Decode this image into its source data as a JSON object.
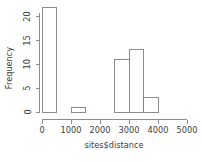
{
  "chart_data": {
    "type": "bar",
    "subtype": "histogram",
    "title": "",
    "xlabel": "sites$distance",
    "ylabel": "Frequency",
    "xlim": [
      0,
      5000
    ],
    "ylim": [
      0,
      22
    ],
    "grid": false,
    "legend": null,
    "bin_width": 500,
    "x_ticks": [
      0,
      1000,
      2000,
      3000,
      4000,
      5000
    ],
    "x_tick_labels": [
      "0",
      "1000",
      "2000",
      "3000",
      "4000",
      "5000"
    ],
    "y_ticks": [
      0,
      5,
      10,
      15,
      20
    ],
    "y_tick_labels": [
      "0",
      "5",
      "10",
      "15",
      "20"
    ],
    "bins": [
      {
        "start": 0,
        "end": 500,
        "value": 22
      },
      {
        "start": 500,
        "end": 1000,
        "value": 0
      },
      {
        "start": 1000,
        "end": 1500,
        "value": 1
      },
      {
        "start": 1500,
        "end": 2000,
        "value": 0
      },
      {
        "start": 2000,
        "end": 2500,
        "value": 0
      },
      {
        "start": 2500,
        "end": 3000,
        "value": 11
      },
      {
        "start": 3000,
        "end": 3500,
        "value": 13
      },
      {
        "start": 3500,
        "end": 4000,
        "value": 3
      }
    ],
    "categories": [
      "0-500",
      "500-1000",
      "1000-1500",
      "1500-2000",
      "2000-2500",
      "2500-3000",
      "3000-3500",
      "3500-4000"
    ],
    "values": [
      22,
      0,
      1,
      0,
      0,
      11,
      13,
      3
    ],
    "colors": {
      "bar_fill": "#ffffff",
      "bar_stroke": "#808080",
      "axis": "#808080",
      "text": "#404040",
      "background": "#ffffff"
    }
  }
}
